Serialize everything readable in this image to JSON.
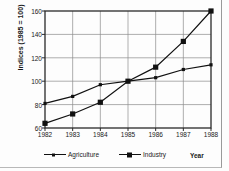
{
  "chart_data": {
    "type": "line",
    "title": "",
    "xlabel": "Year",
    "ylabel": "Indices (1985 = 100)",
    "x": [
      1982,
      1983,
      1984,
      1985,
      1986,
      1987,
      1988
    ],
    "xticklabels": [
      "1982",
      "1983",
      "1984",
      "1985",
      "1986",
      "1987",
      "1988"
    ],
    "yticklabels": [
      "60",
      "80",
      "100",
      "120",
      "140",
      "160"
    ],
    "yticks": [
      60,
      80,
      100,
      120,
      140,
      160
    ],
    "xlim": [
      1982,
      1988
    ],
    "ylim": [
      60,
      160
    ],
    "grid": true,
    "legend_position": "bottom",
    "series": [
      {
        "name": "Agriculture",
        "marker": "small-square",
        "color": "#111111",
        "values": [
          81,
          87,
          97,
          100,
          103,
          110,
          114
        ]
      },
      {
        "name": "Industry",
        "marker": "large-square",
        "color": "#111111",
        "values": [
          64,
          72,
          82,
          100,
          112,
          134,
          160
        ]
      }
    ]
  },
  "legend": {
    "items": [
      {
        "label": "Agriculture"
      },
      {
        "label": "Industry"
      }
    ]
  },
  "axis": {
    "x_title": "Year",
    "y_title": "Indices (1985 = 100)"
  },
  "colors": {
    "line": "#111111",
    "grid": "#8c8c8c",
    "frame": "#2a2a2a",
    "background": "#fdfdfd"
  }
}
